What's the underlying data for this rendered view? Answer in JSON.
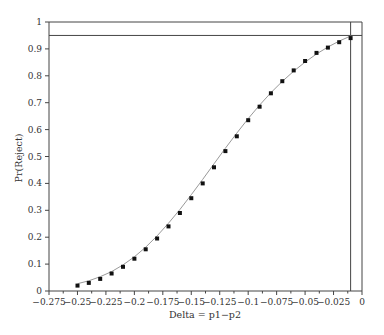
{
  "chart_data": {
    "type": "scatter",
    "title": "",
    "xlabel": "Delta = p1−p2",
    "ylabel": "Pr(Reject)",
    "xlim": [
      -0.275,
      0
    ],
    "ylim": [
      0,
      1
    ],
    "grid": false,
    "legend": null,
    "x_ticks": [
      "−0.275",
      "−0.25",
      "−0.225",
      "−0.2",
      "−0.175",
      "−0.15",
      "−0.125",
      "−0.1",
      "−0.075",
      "−0.05",
      "−0.025",
      "0"
    ],
    "x_tick_values": [
      -0.275,
      -0.25,
      -0.225,
      -0.2,
      -0.175,
      -0.15,
      -0.125,
      -0.1,
      -0.075,
      -0.05,
      -0.025,
      0
    ],
    "y_ticks": [
      "0",
      "0.1",
      "0.2",
      "0.3",
      "0.4",
      "0.5",
      "0.6",
      "0.7",
      "0.8",
      "0.9",
      "1"
    ],
    "y_tick_values": [
      0,
      0.1,
      0.2,
      0.3,
      0.4,
      0.5,
      0.6,
      0.7,
      0.8,
      0.9,
      1
    ],
    "series": [
      {
        "name": "simulated",
        "style": "square-markers",
        "x": [
          -0.25,
          -0.24,
          -0.23,
          -0.22,
          -0.21,
          -0.2,
          -0.19,
          -0.18,
          -0.17,
          -0.16,
          -0.15,
          -0.14,
          -0.13,
          -0.12,
          -0.11,
          -0.1,
          -0.09,
          -0.08,
          -0.07,
          -0.06,
          -0.05,
          -0.04,
          -0.03,
          -0.02,
          -0.01
        ],
        "y": [
          0.02,
          0.03,
          0.045,
          0.065,
          0.09,
          0.12,
          0.155,
          0.195,
          0.24,
          0.29,
          0.345,
          0.4,
          0.46,
          0.52,
          0.575,
          0.635,
          0.685,
          0.735,
          0.78,
          0.82,
          0.855,
          0.885,
          0.905,
          0.925,
          0.94
        ]
      },
      {
        "name": "theoretical",
        "style": "gray-line",
        "x": [
          -0.25,
          -0.24,
          -0.23,
          -0.22,
          -0.21,
          -0.2,
          -0.19,
          -0.18,
          -0.17,
          -0.16,
          -0.15,
          -0.14,
          -0.13,
          -0.12,
          -0.11,
          -0.1,
          -0.09,
          -0.08,
          -0.07,
          -0.06,
          -0.05,
          -0.04,
          -0.03,
          -0.02,
          -0.01
        ],
        "y": [
          0.027,
          0.038,
          0.053,
          0.072,
          0.097,
          0.127,
          0.163,
          0.205,
          0.252,
          0.303,
          0.358,
          0.415,
          0.473,
          0.531,
          0.587,
          0.641,
          0.691,
          0.737,
          0.779,
          0.817,
          0.851,
          0.881,
          0.907,
          0.929,
          0.948
        ]
      }
    ],
    "reference_lines": [
      {
        "orientation": "horizontal",
        "value": 0.95
      },
      {
        "orientation": "vertical",
        "value": -0.01
      }
    ]
  },
  "colors": {
    "axis": "#444444",
    "marker": "#111111",
    "curve": "#999999",
    "reference": "#444444"
  }
}
